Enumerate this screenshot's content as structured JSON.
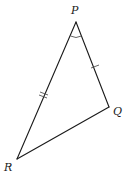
{
  "diagram": {
    "type": "triangle",
    "vertices": [
      {
        "name": "P",
        "x": 76,
        "y": 22,
        "label_x": 71,
        "label_y": 14
      },
      {
        "name": "Q",
        "x": 109,
        "y": 107,
        "label_x": 113,
        "label_y": 115
      },
      {
        "name": "R",
        "x": 17,
        "y": 159,
        "label_x": 4,
        "label_y": 171
      }
    ],
    "labels": {
      "P": "P",
      "Q": "Q",
      "R": "R"
    },
    "equal_sides": [
      "PR",
      "PQ"
    ],
    "angle_marked": "P",
    "colors": {
      "stroke": "#1a1a1a",
      "background": "#ffffff"
    }
  }
}
